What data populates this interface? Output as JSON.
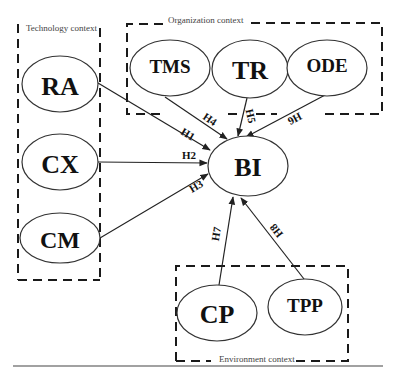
{
  "diagram": {
    "type": "conceptual-model",
    "contexts": [
      {
        "id": "technology",
        "label": "Technology context",
        "members": [
          "RA",
          "CX",
          "CM"
        ]
      },
      {
        "id": "organization",
        "label": "Organization context",
        "members": [
          "TMS",
          "TR",
          "ODE"
        ]
      },
      {
        "id": "environment",
        "label": "Environment context",
        "members": [
          "CP",
          "TPP"
        ]
      }
    ],
    "nodes": {
      "RA": "RA",
      "CX": "CX",
      "CM": "CM",
      "TMS": "TMS",
      "TR": "TR",
      "ODE": "ODE",
      "BI": "BI",
      "CP": "CP",
      "TPP": "TPP"
    },
    "edges": [
      {
        "from": "RA",
        "to": "BI",
        "label": "H1"
      },
      {
        "from": "CX",
        "to": "BI",
        "label": "H2"
      },
      {
        "from": "CM",
        "to": "BI",
        "label": "H3"
      },
      {
        "from": "TMS",
        "to": "BI",
        "label": "H4"
      },
      {
        "from": "TR",
        "to": "BI",
        "label": "H5"
      },
      {
        "from": "ODE",
        "to": "BI",
        "label": "H6"
      },
      {
        "from": "CP",
        "to": "BI",
        "label": "H7"
      },
      {
        "from": "TPP",
        "to": "BI",
        "label": "H8"
      }
    ],
    "edge_labels": {
      "h1": "H1",
      "h2": "H2",
      "h3": "H3",
      "h4": "H4",
      "h5": "H5",
      "h6": "H6",
      "h7": "H7",
      "h8": "H8"
    },
    "context_labels": {
      "technology": "Technology context",
      "organization": "Organization context",
      "environment": "Environment context"
    }
  }
}
